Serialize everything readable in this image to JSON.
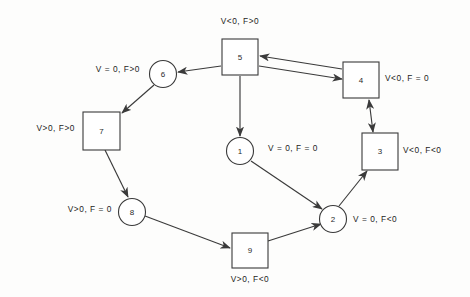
{
  "diagram": {
    "type": "state-transition-diagram",
    "background_color": "#fdfdfc",
    "stroke_color": "#3a3a3a",
    "nodes": [
      {
        "id": "1",
        "label": "1",
        "shape": "circle",
        "cx": 240,
        "cy": 151,
        "r": 13.5,
        "condition": "V = 0, F = 0",
        "cond_x": 268,
        "cond_y": 151,
        "cond_anchor": "start"
      },
      {
        "id": "2",
        "label": "2",
        "shape": "circle",
        "cx": 333,
        "cy": 219,
        "r": 13.5,
        "condition": "V = 0, F<0",
        "cond_x": 353,
        "cond_y": 222,
        "cond_anchor": "start"
      },
      {
        "id": "3",
        "label": "3",
        "shape": "square",
        "x": 362,
        "y": 133,
        "w": 36,
        "h": 37,
        "condition": "V<0, F<0",
        "cond_x": 403,
        "cond_y": 153,
        "cond_anchor": "start"
      },
      {
        "id": "4",
        "label": "4",
        "shape": "square",
        "x": 343,
        "y": 62,
        "w": 36,
        "h": 36,
        "condition": "V<0, F = 0",
        "cond_x": 385,
        "cond_y": 81,
        "cond_anchor": "start"
      },
      {
        "id": "5",
        "label": "5",
        "shape": "square",
        "x": 222,
        "y": 39,
        "w": 36,
        "h": 36,
        "condition": "V<0, F>0",
        "cond_x": 240,
        "cond_y": 24,
        "cond_anchor": "middle"
      },
      {
        "id": "6",
        "label": "6",
        "shape": "circle",
        "cx": 163,
        "cy": 74,
        "r": 13.5,
        "condition": "V = 0, F>0",
        "cond_x": 140,
        "cond_y": 72,
        "cond_anchor": "end"
      },
      {
        "id": "7",
        "label": "7",
        "shape": "square",
        "x": 83,
        "y": 112,
        "w": 37,
        "h": 38,
        "condition": "V>0, F>0",
        "cond_x": 75,
        "cond_y": 131,
        "cond_anchor": "end"
      },
      {
        "id": "8",
        "label": "8",
        "shape": "circle",
        "cx": 132,
        "cy": 212,
        "r": 13.5,
        "condition": "V>0, F = 0",
        "cond_x": 112,
        "cond_y": 212,
        "cond_anchor": "end"
      },
      {
        "id": "9",
        "label": "9",
        "shape": "square",
        "x": 232,
        "y": 233,
        "w": 36,
        "h": 35,
        "condition": "V>0, F<0",
        "cond_x": 250,
        "cond_y": 282,
        "cond_anchor": "middle"
      }
    ],
    "edges": [
      {
        "from": "5",
        "to": "6",
        "x1": 221,
        "y1": 66,
        "x2": 178,
        "y2": 72,
        "arrow": "end"
      },
      {
        "from": "6",
        "to": "7",
        "x1": 154,
        "y1": 85,
        "x2": 122,
        "y2": 113,
        "arrow": "end"
      },
      {
        "from": "7",
        "to": "8",
        "x1": 105,
        "y1": 150,
        "x2": 128,
        "y2": 197,
        "arrow": "end"
      },
      {
        "from": "8",
        "to": "9",
        "x1": 145,
        "y1": 216,
        "x2": 230,
        "y2": 248,
        "arrow": "end"
      },
      {
        "from": "9",
        "to": "2",
        "x1": 268,
        "y1": 241,
        "x2": 321,
        "y2": 224,
        "arrow": "end"
      },
      {
        "from": "2",
        "to": "3",
        "x1": 339,
        "y1": 206,
        "x2": 367,
        "y2": 171,
        "arrow": "end"
      },
      {
        "from": "3",
        "to": "4",
        "x1": 373,
        "y1": 132,
        "x2": 369,
        "y2": 100,
        "arrow": "both"
      },
      {
        "from": "5",
        "to": "4",
        "x1": 259,
        "y1": 66,
        "x2": 342,
        "y2": 79,
        "arrow": "end"
      },
      {
        "from": "5",
        "to": "1",
        "x1": 240,
        "y1": 76,
        "x2": 240,
        "y2": 136,
        "arrow": "end"
      },
      {
        "from": "1",
        "to": "2",
        "x1": 251,
        "y1": 161,
        "x2": 322,
        "y2": 209,
        "arrow": "end"
      },
      {
        "from": "4",
        "to": "5",
        "x1": 342,
        "y1": 69,
        "x2": 260,
        "y2": 56,
        "arrow": "end"
      }
    ]
  }
}
